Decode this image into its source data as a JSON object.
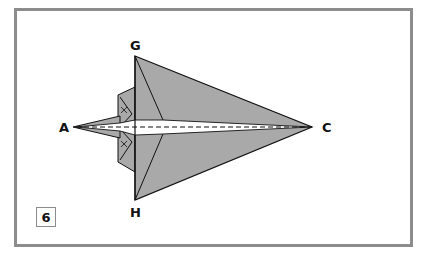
{
  "diagram": {
    "step_number": "6",
    "points": {
      "A": {
        "label": "A"
      },
      "C": {
        "label": "C"
      },
      "G": {
        "label": "G"
      },
      "H": {
        "label": "H"
      }
    },
    "colors": {
      "paper_fill": "#a9a9a9",
      "stroke": "#111111",
      "frame_border": "#8c8c8c",
      "inner_slit": "#ffffff"
    }
  }
}
